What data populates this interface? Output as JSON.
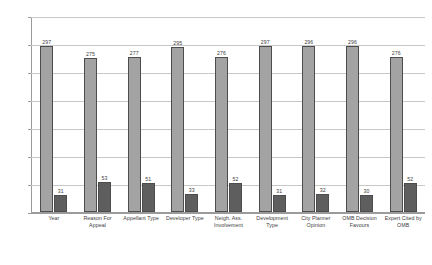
{
  "chart_data": {
    "type": "bar",
    "title": "",
    "subtitle": "",
    "xlabel": "",
    "ylabel": "",
    "ylim": [
      0,
      350
    ],
    "yticks": [
      0,
      50,
      100,
      150,
      200,
      250,
      300,
      350
    ],
    "grid": true,
    "legend": "none",
    "categories": [
      "Year",
      "Reason For Appeal",
      "Appellant Type",
      "Developer Type",
      "Neigh. Ass. Involvement",
      "Development Type",
      "City Planner Opinion",
      "OMB Decision Favours",
      "Expert Cited by OMB"
    ],
    "series": [
      {
        "name": "series-light",
        "color": "#a3a3a3",
        "values": [
          297,
          275,
          277,
          295,
          276,
          297,
          296,
          296,
          276
        ]
      },
      {
        "name": "series-dark",
        "color": "#5e5e5e",
        "values": [
          31,
          53,
          51,
          33,
          52,
          31,
          32,
          30,
          52
        ]
      }
    ]
  },
  "colors": {
    "light_bar": "#a3a3a3",
    "dark_bar": "#5e5e5e",
    "bar_border": "#4d4d4d",
    "grid": "#c8c8c8",
    "axis": "#9b9b9b",
    "text": "#3c3c3c",
    "background": "#ffffff"
  }
}
